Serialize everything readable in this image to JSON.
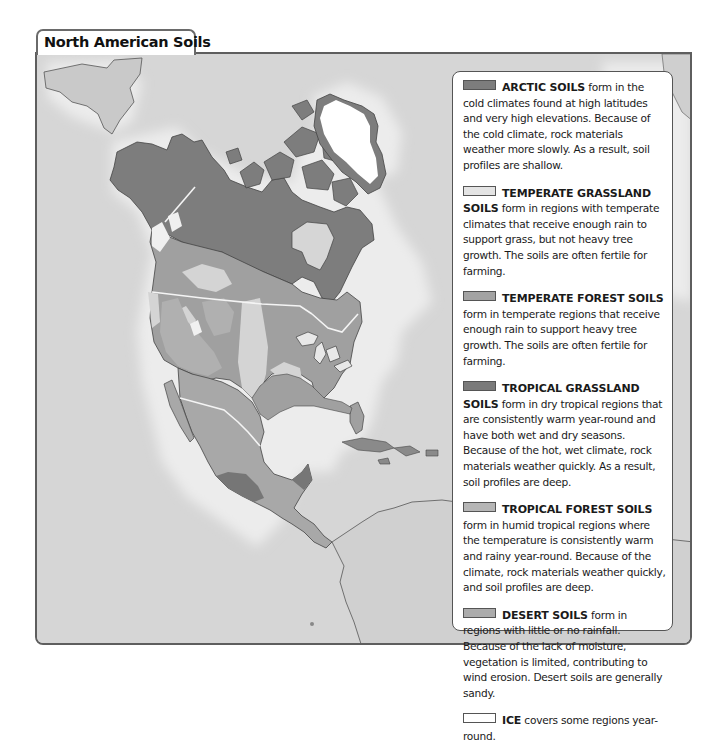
{
  "map": {
    "title": "North American Soils",
    "colors": {
      "ocean": "#d9d9d9",
      "ocean_glow": "#eeeeee",
      "arctic": "#7d7d7d",
      "temperate_grassland": "#d6d6d6",
      "temperate_forest": "#a0a0a0",
      "tropical_grassland": "#767676",
      "tropical_forest": "#b4b4b4",
      "desert": "#aeaeae",
      "ice": "#ffffff",
      "border": "#f2f2f2",
      "coast": "#4a4a4a"
    }
  },
  "legend": {
    "entries": [
      {
        "term": "ARCTIC SOILS",
        "swatch": "#7d7d7d",
        "text": " form in the cold climates found at high latitudes and very high elevations. Because of the cold climate, rock materials weather more slowly. As a result, soil profiles are shallow."
      },
      {
        "term": "TEMPERATE GRASSLAND SOILS",
        "swatch": "#e4e4e4",
        "text": " form in regions with temperate climates that receive enough rain to support grass, but not heavy tree growth. The soils are often fertile for farming."
      },
      {
        "term": "TEMPERATE FOREST SOILS",
        "swatch": "#a3a3a3",
        "text": " form in temperate regions that receive enough rain to support heavy tree growth. The soils are often fertile for farming."
      },
      {
        "term": "TROPICAL GRASSLAND SOILS",
        "swatch": "#7a7a7a",
        "text": " form in dry tropical regions that are consistently warm year-round and have both wet and dry seasons. Because of the hot, wet climate, rock materials weather quickly. As a result, soil profiles are deep."
      },
      {
        "term": "TROPICAL FOREST SOILS",
        "swatch": "#b6b6b6",
        "text": " form in humid tropical regions where the temperature is consistently warm and rainy year-round. Because of the climate, rock materials weather quickly, and soil profiles are deep."
      },
      {
        "term": "DESERT SOILS",
        "swatch": "#acacac",
        "text": " form in regions with little or no rainfall. Because of the lack of moisture, vegetation is limited, contributing to wind erosion. Desert soils are generally sandy."
      },
      {
        "term": "ICE",
        "swatch": "#ffffff",
        "text": " covers some regions year-round."
      }
    ]
  }
}
